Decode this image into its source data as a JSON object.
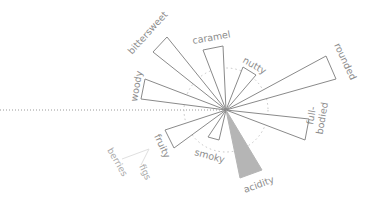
{
  "chart_data": {
    "type": "radial-wedge",
    "title": "",
    "center": [
      226,
      110
    ],
    "reference_ring_radius": 42,
    "reference_axis": "dotted horizontal line extending left from center",
    "categories": [
      "bittersweet",
      "caramel",
      "nutty",
      "rounded",
      "full-bodied",
      "acidity",
      "smoky",
      "fruity",
      "woody"
    ],
    "highlighted": "acidity",
    "wedges": [
      {
        "label": "bittersweet",
        "corners": [
          [
            153,
            52
          ],
          [
            167,
            37
          ]
        ],
        "filled": false,
        "label_pos": [
          132,
          55
        ],
        "label_rot": -48
      },
      {
        "label": "caramel",
        "corners": [
          [
            203,
            50
          ],
          [
            223,
            46
          ]
        ],
        "filled": false,
        "label_pos": [
          193,
          44
        ],
        "label_rot": -10
      },
      {
        "label": "nutty",
        "corners": [
          [
            243,
            67
          ],
          [
            256,
            75
          ]
        ],
        "filled": false,
        "label_pos": [
          242,
          62
        ],
        "label_rot": 30
      },
      {
        "label": "rounded",
        "corners": [
          [
            326,
            56
          ],
          [
            336,
            79
          ]
        ],
        "filled": false,
        "label_pos": [
          334,
          45
        ],
        "label_rot": 65
      },
      {
        "label": "full-bodied",
        "corners": [
          [
            309,
            119
          ],
          [
            305,
            140
          ]
        ],
        "filled": false,
        "label_pos": [
          313,
          125
        ],
        "label_rot": -80
      },
      {
        "label": "acidity",
        "corners": [
          [
            240,
            178
          ],
          [
            262,
            170
          ]
        ],
        "filled": true,
        "label_pos": [
          245,
          193
        ],
        "label_rot": -20
      },
      {
        "label": "smoky",
        "corners": [
          [
            208,
            137
          ],
          [
            219,
            140
          ]
        ],
        "filled": false,
        "label_pos": [
          194,
          155
        ],
        "label_rot": 15
      },
      {
        "label": "fruity",
        "corners": [
          [
            165,
            130
          ],
          [
            174,
            148
          ]
        ],
        "filled": false,
        "label_pos": [
          154,
          136
        ],
        "label_rot": 65
      },
      {
        "label": "woody",
        "corners": [
          [
            145,
            79
          ],
          [
            141,
            99
          ]
        ],
        "filled": false,
        "label_pos": [
          137,
          102
        ],
        "label_rot": -80
      }
    ],
    "sub_labels": [
      {
        "label": "berries",
        "parent": "fruity",
        "label_pos": [
          107,
          150
        ],
        "label_rot": 60
      },
      {
        "label": "figs",
        "parent": "fruity",
        "label_pos": [
          139,
          166
        ],
        "label_rot": 65
      }
    ],
    "colors": {
      "outline": "#8a8a8a",
      "highlight_fill": "#b5b5b5",
      "text": "#8c8c8c"
    }
  }
}
